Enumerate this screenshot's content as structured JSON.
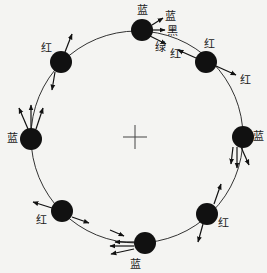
{
  "diagram": {
    "center": {
      "x": 137,
      "y": 137
    },
    "radius": 106,
    "ring_color": "#333333",
    "ball_color": "#111111",
    "ball_radius": 11,
    "balls": [
      {
        "id": "top",
        "x": 142,
        "y": 30,
        "label": "蓝",
        "lx": 142,
        "ly": 10
      },
      {
        "id": "upper-right",
        "x": 206,
        "y": 62,
        "label": "红",
        "lx": 209,
        "ly": 44
      },
      {
        "id": "right",
        "x": 243,
        "y": 137,
        "label": "蓝",
        "lx": 258,
        "ly": 136
      },
      {
        "id": "lower-right",
        "x": 207,
        "y": 214,
        "label": "红",
        "lx": 223,
        "ly": 223
      },
      {
        "id": "bottom",
        "x": 145,
        "y": 243,
        "label": "蓝",
        "lx": 135,
        "ly": 264
      },
      {
        "id": "lower-left",
        "x": 62,
        "y": 211,
        "label": "红",
        "lx": 41,
        "ly": 220
      },
      {
        "id": "left",
        "x": 31,
        "y": 139,
        "label": "蓝",
        "lx": 12,
        "ly": 138
      },
      {
        "id": "upper-left",
        "x": 61,
        "y": 62,
        "label": "红",
        "lx": 46,
        "ly": 48
      }
    ],
    "extra_labels": [
      {
        "text": "蓝",
        "x": 170,
        "y": 16
      },
      {
        "text": "黑",
        "x": 172,
        "y": 31
      },
      {
        "text": "绿",
        "x": 160,
        "y": 47
      },
      {
        "text": "红",
        "x": 175,
        "y": 54
      },
      {
        "text": "红",
        "x": 245,
        "y": 80
      }
    ],
    "arrows": [
      {
        "x1": 152,
        "y1": 25,
        "x2": 163,
        "y2": 18
      },
      {
        "x1": 152,
        "y1": 30,
        "x2": 165,
        "y2": 30
      },
      {
        "x1": 150,
        "y1": 36,
        "x2": 166,
        "y2": 44
      },
      {
        "x1": 196,
        "y1": 58,
        "x2": 178,
        "y2": 50
      },
      {
        "x1": 216,
        "y1": 66,
        "x2": 236,
        "y2": 75
      },
      {
        "x1": 65,
        "y1": 52,
        "x2": 72,
        "y2": 34
      },
      {
        "x1": 55,
        "y1": 72,
        "x2": 52,
        "y2": 90
      },
      {
        "x1": 28,
        "y1": 129,
        "x2": 19,
        "y2": 108
      },
      {
        "x1": 31,
        "y1": 129,
        "x2": 31,
        "y2": 105
      },
      {
        "x1": 36,
        "y1": 129,
        "x2": 43,
        "y2": 108
      },
      {
        "x1": 233,
        "y1": 147,
        "x2": 231,
        "y2": 164
      },
      {
        "x1": 237,
        "y1": 147,
        "x2": 237,
        "y2": 168
      },
      {
        "x1": 241,
        "y1": 147,
        "x2": 249,
        "y2": 165
      },
      {
        "x1": 214,
        "y1": 204,
        "x2": 221,
        "y2": 184
      },
      {
        "x1": 203,
        "y1": 224,
        "x2": 198,
        "y2": 242
      },
      {
        "x1": 52,
        "y1": 208,
        "x2": 33,
        "y2": 202
      },
      {
        "x1": 72,
        "y1": 217,
        "x2": 89,
        "y2": 223
      },
      {
        "x1": 110,
        "y1": 230,
        "x2": 124,
        "y2": 236
      },
      {
        "x1": 134,
        "y1": 242,
        "x2": 115,
        "y2": 242
      },
      {
        "x1": 134,
        "y1": 246,
        "x2": 110,
        "y2": 246
      },
      {
        "x1": 134,
        "y1": 249,
        "x2": 111,
        "y2": 254
      }
    ],
    "cross": {
      "x": 135,
      "y": 137,
      "size": 12
    }
  }
}
